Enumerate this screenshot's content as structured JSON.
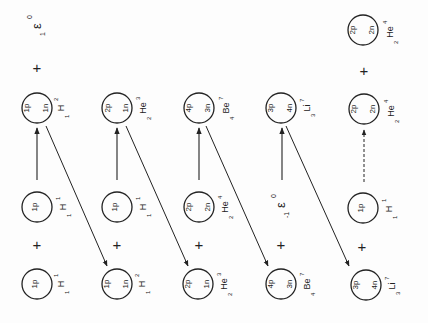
{
  "diagram": {
    "title": "",
    "orientation": "rotated-90-ccw",
    "columns": [
      {
        "reactant_a": {
          "protons": "1p",
          "neutrons": "",
          "symbol": "H",
          "mass": "1",
          "charge": "1"
        },
        "reactant_b": {
          "protons": "1p",
          "neutrons": "",
          "symbol": "H",
          "mass": "1",
          "charge": "1"
        },
        "product": {
          "protons": "1p",
          "neutrons": "1n",
          "symbol": "H",
          "mass": "2",
          "charge": "1"
        },
        "emission": {
          "symbol": "ε",
          "mass": "0",
          "charge": "1"
        }
      },
      {
        "reactant_a": {
          "protons": "1p",
          "neutrons": "1n",
          "symbol": "H",
          "mass": "2",
          "charge": "1"
        },
        "reactant_b": {
          "protons": "1p",
          "neutrons": "",
          "symbol": "H",
          "mass": "1",
          "charge": "1"
        },
        "product": {
          "protons": "2p",
          "neutrons": "1n",
          "symbol": "He",
          "mass": "3",
          "charge": "2"
        }
      },
      {
        "reactant_a": {
          "protons": "2p",
          "neutrons": "1n",
          "symbol": "He",
          "mass": "3",
          "charge": "2"
        },
        "reactant_b": {
          "protons": "2p",
          "neutrons": "2n",
          "symbol": "He",
          "mass": "4",
          "charge": "2"
        },
        "product": {
          "protons": "4p",
          "neutrons": "3n",
          "symbol": "Be",
          "mass": "7",
          "charge": "4"
        }
      },
      {
        "reactant_a": {
          "protons": "4p",
          "neutrons": "3n",
          "symbol": "Be",
          "mass": "7",
          "charge": "4"
        },
        "reactant_b_particle": {
          "symbol": "ε",
          "mass": "0",
          "charge": "-1"
        },
        "product": {
          "protons": "3p",
          "neutrons": "4n",
          "symbol": "Li",
          "mass": "7",
          "charge": "3"
        }
      },
      {
        "reactant_a": {
          "protons": "3p",
          "neutrons": "4n",
          "symbol": "Li",
          "mass": "7",
          "charge": "3"
        },
        "reactant_b": {
          "protons": "1p",
          "neutrons": "",
          "symbol": "H",
          "mass": "1",
          "charge": "1"
        },
        "product": {
          "protons": "2p",
          "neutrons": "2n",
          "symbol": "He",
          "mass": "4",
          "charge": "2"
        },
        "product_extra": {
          "protons": "2p",
          "neutrons": "2n",
          "symbol": "He",
          "mass": "4",
          "charge": "2"
        }
      }
    ],
    "plus_sign": "+",
    "colors": {
      "ink": "#222222",
      "paper": "#fdfdfd"
    }
  }
}
